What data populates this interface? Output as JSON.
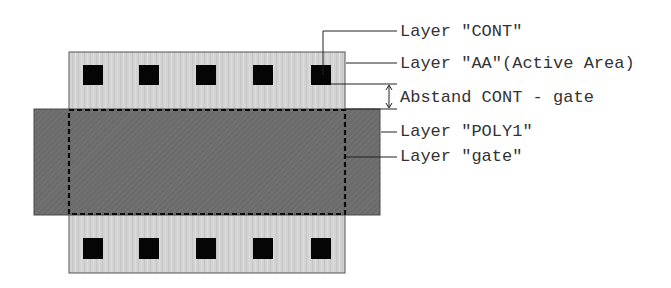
{
  "diagram": {
    "type": "ic-layout-transistor",
    "colors": {
      "active_area_fill": "#d3d3d3",
      "active_area_stripe": "#c4c4c4",
      "poly_fill": "#6b6b6b",
      "poly_stripe": "#7a7a7a",
      "contact_fill": "#050505",
      "outline": "#555555",
      "leader_line": "#222222",
      "text": "#333333"
    },
    "shapes": {
      "active_area": {
        "x": 69,
        "y": 52,
        "w": 276,
        "h": 221
      },
      "poly1": {
        "x": 34,
        "y": 109,
        "w": 346,
        "h": 106
      },
      "gate": {
        "x": 69,
        "y": 110,
        "w": 276,
        "h": 104
      },
      "contacts_top": [
        {
          "x": 83,
          "y": 65,
          "w": 20,
          "h": 20
        },
        {
          "x": 139,
          "y": 65,
          "w": 20,
          "h": 20
        },
        {
          "x": 196,
          "y": 65,
          "w": 20,
          "h": 20
        },
        {
          "x": 253,
          "y": 65,
          "w": 20,
          "h": 20
        },
        {
          "x": 311,
          "y": 65,
          "w": 20,
          "h": 20
        }
      ],
      "contacts_bottom": [
        {
          "x": 83,
          "y": 238,
          "w": 20,
          "h": 21
        },
        {
          "x": 139,
          "y": 238,
          "w": 20,
          "h": 21
        },
        {
          "x": 196,
          "y": 238,
          "w": 20,
          "h": 21
        },
        {
          "x": 253,
          "y": 238,
          "w": 20,
          "h": 21
        },
        {
          "x": 311,
          "y": 238,
          "w": 20,
          "h": 21
        }
      ]
    },
    "labels": {
      "cont": "Layer \"CONT\"",
      "aa": "Layer \"AA\"(Active Area)",
      "abstand": "Abstand CONT - gate",
      "poly1": "Layer \"POLY1\"",
      "gate": "Layer \"gate\""
    }
  }
}
